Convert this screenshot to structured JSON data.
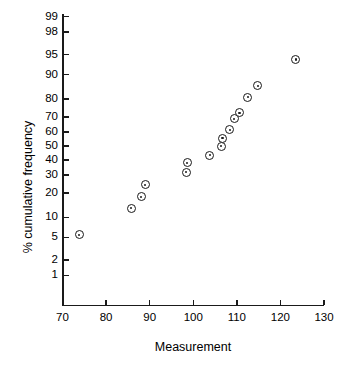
{
  "figure": {
    "width": 359,
    "height": 375,
    "background": "#ffffff",
    "ink_color": "#1a1a1a"
  },
  "axes": {
    "x_title": "Measurement",
    "y_title": "% cumulative frequency"
  },
  "chart_data": {
    "type": "scatter",
    "title": "",
    "subtitle": "",
    "xlabel": "Measurement",
    "ylabel": "% cumulative frequency",
    "x_scale": "linear",
    "y_scale": "normal-probability (probit)",
    "xlim": [
      70,
      133
    ],
    "ylim": [
      0.6,
      99.6
    ],
    "grid": false,
    "legend": null,
    "annotations": [],
    "x_ticks": [
      70,
      80,
      90,
      100,
      110,
      120,
      130
    ],
    "x_tick_labels": [
      "70",
      "80",
      "90",
      "100",
      "110",
      "120",
      "130"
    ],
    "y_ticks": [
      99,
      98,
      95,
      90,
      80,
      70,
      60,
      50,
      40,
      30,
      20,
      10,
      5,
      2,
      1
    ],
    "y_tick_labels": [
      "99",
      "98",
      "95",
      "90",
      "80",
      "70",
      "60",
      "50",
      "40",
      "30",
      "20",
      "10",
      "5",
      "2",
      "1"
    ],
    "marker": "circle-with-center-dot",
    "marker_face": "#ffffff",
    "marker_edge": "#1a1a1a",
    "x": [
      73.8,
      85.8,
      88.1,
      89.0,
      98.4,
      98.6,
      103.8,
      106.4,
      106.7,
      108.4,
      109.4,
      110.6,
      112.5,
      114.8,
      123.5
    ],
    "y": [
      5.5,
      13.2,
      18.0,
      24.2,
      31.8,
      38.2,
      43.5,
      50.0,
      55.5,
      61.5,
      68.8,
      72.5,
      81.0,
      86.0,
      94.0
    ],
    "points": [
      {
        "x": 73.8,
        "y": 5.5
      },
      {
        "x": 85.8,
        "y": 13.2
      },
      {
        "x": 88.1,
        "y": 18.0
      },
      {
        "x": 89.0,
        "y": 24.2
      },
      {
        "x": 98.4,
        "y": 31.8
      },
      {
        "x": 98.6,
        "y": 38.2
      },
      {
        "x": 103.8,
        "y": 43.5
      },
      {
        "x": 106.4,
        "y": 50.0
      },
      {
        "x": 106.7,
        "y": 55.5
      },
      {
        "x": 108.4,
        "y": 61.5
      },
      {
        "x": 109.4,
        "y": 68.8
      },
      {
        "x": 110.6,
        "y": 72.5
      },
      {
        "x": 112.5,
        "y": 81.0
      },
      {
        "x": 114.8,
        "y": 86.0
      },
      {
        "x": 123.5,
        "y": 94.0
      }
    ]
  }
}
